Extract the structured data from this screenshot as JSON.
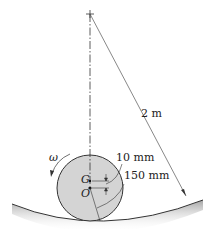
{
  "diagram": {
    "labels": {
      "radius_path": "2 m",
      "offset_dim": "10 mm",
      "disk_radius": "150 mm",
      "center_of_mass": "G",
      "geometric_center": "O",
      "angular_velocity": "ω"
    },
    "colors": {
      "disk_fill": "#d4d4d4",
      "line": "#333333",
      "surface_shade": "#bdbdbd"
    }
  }
}
